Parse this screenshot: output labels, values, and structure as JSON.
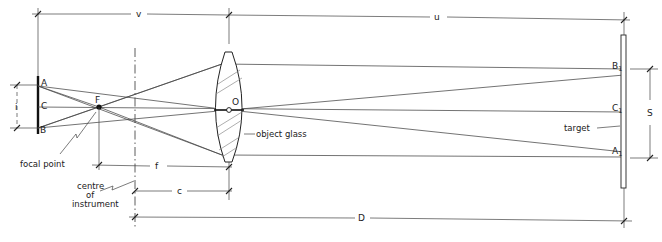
{
  "diagram": {
    "title": "",
    "colors": {
      "ink": "#333333",
      "background": "#ffffff"
    },
    "dimensions": {
      "v": "v",
      "u": "u",
      "i": "i",
      "s": "S",
      "f": "f",
      "c": "c",
      "d": "D"
    },
    "points": {
      "a": "A",
      "c": "C",
      "b": "B",
      "f": "F",
      "o": "O",
      "b1_main": "B",
      "b1_sub": "1",
      "c1_main": "C",
      "c1_sub": "1",
      "a1_main": "A",
      "a1_sub": "1"
    },
    "annotations": {
      "focal_point": "focal  point",
      "centre_line1": "centre",
      "centre_line2": "of",
      "centre_line3": "instrument",
      "object_glass": "object  glass",
      "target": "target"
    }
  }
}
